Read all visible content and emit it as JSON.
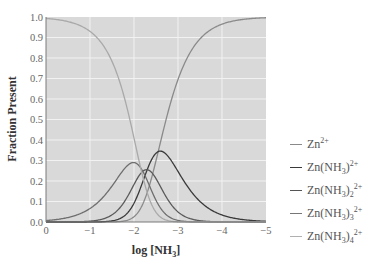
{
  "chart_data": {
    "type": "line",
    "title": "",
    "xlabel": "log [NH3]",
    "ylabel": "Fraction Present",
    "xlim": [
      0,
      -5
    ],
    "ylim": [
      0.0,
      1.0
    ],
    "x_ticks": [
      "0",
      "−1",
      "−2",
      "−3",
      "−4",
      "−5"
    ],
    "y_ticks": [
      "0.0",
      "0.1",
      "0.2",
      "0.3",
      "0.4",
      "0.5",
      "0.6",
      "0.7",
      "0.8",
      "0.9",
      "1.0"
    ],
    "grid": true,
    "legend_position": "right",
    "note": "Curves are generated from effective fitting parameters tuned to match the pictured shapes (crossings, peak heights, widths); they are not the textbook Zn–NH3 stepwise formation constants. Species-to-curve assignment follows the figure's legend colors as drawn, not a chemistry-derived mapping.",
    "model": {
      "description": "Approximate chart-space fit. fraction_i = B_i L^i / sum_j B_j L^j with L = 10^(log[NH3]). log_cumulative values are hand-tuned curve-shape parameters, not literature beta_i.",
      "log_cumulative": [
        0,
        2.55,
        4.85,
        7.05,
        9.2
      ]
    },
    "series": [
      {
        "name": "Zn2+",
        "color": "#8a8a8a",
        "approx_points": [
          [
            0,
            0.0
          ],
          [
            -1,
            0.0
          ],
          [
            -2,
            0.04
          ],
          [
            -2.5,
            0.33
          ],
          [
            -3,
            0.79
          ],
          [
            -4,
            0.997
          ],
          [
            -5,
            1.0
          ]
        ]
      },
      {
        "name": "Zn(NH3)2+",
        "color": "#3a3a3a",
        "approx_points": [
          [
            0,
            0.0
          ],
          [
            -1,
            0.003
          ],
          [
            -2,
            0.09
          ],
          [
            -2.6,
            0.24
          ],
          [
            -3,
            0.2
          ],
          [
            -4,
            0.03
          ],
          [
            -5,
            0.003
          ]
        ]
      },
      {
        "name": "Zn(NH3)2 2+",
        "color": "#555555",
        "approx_points": [
          [
            0,
            0.0
          ],
          [
            -1,
            0.01
          ],
          [
            -2,
            0.18
          ],
          [
            -2.35,
            0.2
          ],
          [
            -3,
            0.05
          ],
          [
            -4,
            0.0
          ]
        ]
      },
      {
        "name": "Zn(NH3)3 2+",
        "color": "#777777",
        "approx_points": [
          [
            0,
            0.03
          ],
          [
            -1,
            0.12
          ],
          [
            -2,
            0.35
          ],
          [
            -2.4,
            0.21
          ],
          [
            -3,
            0.02
          ],
          [
            -4,
            0.0
          ]
        ]
      },
      {
        "name": "Zn(NH3)4 2+",
        "color": "#b0b0b0",
        "approx_points": [
          [
            0,
            0.97
          ],
          [
            -1,
            0.87
          ],
          [
            -2,
            0.41
          ],
          [
            -2.5,
            0.08
          ],
          [
            -3,
            0.0
          ]
        ]
      }
    ],
    "curve_draw_colors": [
      "#8a8a8a",
      "#3a3a3a",
      "#5a5a5a",
      "#6e6e6e",
      "#a9a9a9"
    ],
    "draw_order_species_index": [
      0,
      1,
      2,
      3,
      4
    ]
  },
  "legend": [
    {
      "base": "Zn",
      "paren": "",
      "sub": "",
      "charge": "2+",
      "color": "#8a8a8a"
    },
    {
      "base": "Zn(NH",
      "paren": "3",
      "close": ")",
      "sub": "",
      "charge": "2+",
      "color": "#3a3a3a"
    },
    {
      "base": "Zn(NH",
      "paren": "3",
      "close": ")",
      "sub": "2",
      "charge": "2+",
      "color": "#555555"
    },
    {
      "base": "Zn(NH",
      "paren": "3",
      "close": ")",
      "sub": "3",
      "charge": "2+",
      "color": "#777777"
    },
    {
      "base": "Zn(NH",
      "paren": "3",
      "close": ")",
      "sub": "4",
      "charge": "2+",
      "color": "#b0b0b0"
    }
  ],
  "axes": {
    "xlabel_text": "log [NH",
    "xlabel_sub": "3",
    "xlabel_close": "]",
    "ylabel_text": "Fraction Present"
  },
  "style": {
    "plot_bg": "#d9d9d9",
    "grid_color": "#f2f2f2",
    "axis_color": "#7a7a7a"
  }
}
